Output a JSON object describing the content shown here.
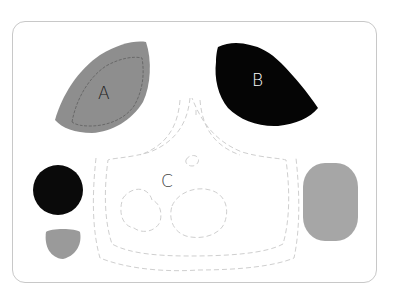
{
  "diagram": {
    "labels": {
      "a": "A",
      "b": "B",
      "c": "C"
    },
    "colors": {
      "frame": "#c8c8c8",
      "shape_a": "#8e8e8e",
      "shape_a_outline": "#5a5a5a",
      "shape_b": "#050505",
      "label_b": "#ffffff",
      "outline_c": "#cfcfcf",
      "circle_black": "#0a0a0a",
      "small_gray": "#9a9a9a",
      "rect_gray": "#a6a6a6"
    }
  }
}
